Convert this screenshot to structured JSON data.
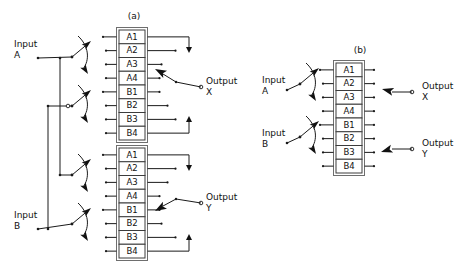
{
  "figure": {
    "background": "#ffffff",
    "line_color": "#1a1a1a",
    "text_color": "#111111",
    "cell_border_color": "#3c3c3c",
    "width": 468,
    "height": 269
  },
  "panels": [
    {
      "id": "panel-a",
      "caption": "(a)",
      "caption_x": 134,
      "caption_y": 19,
      "inputs": [
        {
          "name": "input-a",
          "line1": "Input",
          "line2": "A",
          "x": 14,
          "y": 47
        },
        {
          "name": "input-b",
          "line1": "Input",
          "line2": "B",
          "x": 14,
          "y": 218
        }
      ],
      "outputs": [
        {
          "name": "output-x",
          "line1": "Output",
          "line2": "X",
          "x": 206,
          "y": 84
        },
        {
          "name": "output-y",
          "line1": "Output",
          "line2": "Y",
          "x": 206,
          "y": 200
        }
      ],
      "stacks": [
        {
          "id": "stack-a-upper",
          "x": 119,
          "y": 30,
          "cell_w": 26,
          "cell_h": 13.75,
          "cells": [
            "A1",
            "A2",
            "A3",
            "A4",
            "B1",
            "B2",
            "B3",
            "B4"
          ]
        },
        {
          "id": "stack-a-lower",
          "x": 119,
          "y": 148,
          "cell_w": 26,
          "cell_h": 13.75,
          "cells": [
            "A1",
            "A2",
            "A3",
            "A4",
            "B1",
            "B2",
            "B3",
            "B4"
          ]
        }
      ],
      "switches": [
        {
          "id": "switch-a1",
          "x": 72,
          "y": 57
        },
        {
          "id": "switch-a2",
          "x": 72,
          "y": 106
        },
        {
          "id": "switch-a3",
          "x": 72,
          "y": 175
        },
        {
          "id": "switch-a4",
          "x": 72,
          "y": 224
        }
      ]
    },
    {
      "id": "panel-b",
      "caption": "(b)",
      "caption_x": 360,
      "caption_y": 53,
      "inputs": [
        {
          "name": "input-a",
          "line1": "Input",
          "line2": "A",
          "x": 262,
          "y": 83
        },
        {
          "name": "input-b",
          "line1": "Input",
          "line2": "B",
          "x": 262,
          "y": 136
        }
      ],
      "outputs": [
        {
          "name": "output-x",
          "line1": "Output",
          "line2": "X",
          "x": 422,
          "y": 89
        },
        {
          "name": "output-y",
          "line1": "Output",
          "line2": "Y",
          "x": 422,
          "y": 146
        }
      ],
      "stacks": [
        {
          "id": "stack-b",
          "x": 336,
          "y": 63,
          "cell_w": 26,
          "cell_h": 13.75,
          "cells": [
            "A1",
            "A2",
            "A3",
            "A4",
            "B1",
            "B2",
            "B3",
            "B4"
          ]
        }
      ],
      "switches": [
        {
          "id": "switch-b1",
          "x": 300,
          "y": 84
        },
        {
          "id": "switch-b2",
          "x": 300,
          "y": 137
        }
      ]
    }
  ]
}
